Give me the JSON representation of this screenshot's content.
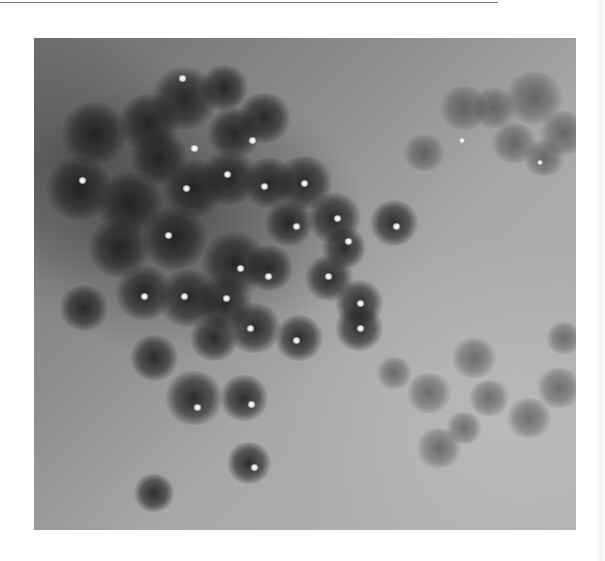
{
  "figure": {
    "palette": {
      "background_light": "#b2b2b2",
      "background_dark": "#6e6e6e",
      "papule": "#232323",
      "highlight": "#ffffff",
      "page": "#ffffff",
      "rule": "#7a7a7a"
    },
    "papules": [
      {
        "x": 150,
        "y": 60,
        "r": 30,
        "glint": false
      },
      {
        "x": 115,
        "y": 85,
        "r": 28,
        "glint": false
      },
      {
        "x": 60,
        "y": 95,
        "r": 30,
        "glint": false
      },
      {
        "x": 190,
        "y": 50,
        "r": 22,
        "glint": true,
        "gx": 148,
        "gy": 40
      },
      {
        "x": 230,
        "y": 80,
        "r": 24,
        "glint": false
      },
      {
        "x": 125,
        "y": 120,
        "r": 26,
        "glint": true,
        "gx": 160,
        "gy": 110
      },
      {
        "x": 200,
        "y": 95,
        "r": 24,
        "glint": true,
        "gx": 218,
        "gy": 102
      },
      {
        "x": 45,
        "y": 150,
        "r": 30,
        "glint": true,
        "gx": 48,
        "gy": 142
      },
      {
        "x": 95,
        "y": 165,
        "r": 30,
        "glint": false
      },
      {
        "x": 160,
        "y": 150,
        "r": 28,
        "glint": true,
        "gx": 152,
        "gy": 150
      },
      {
        "x": 195,
        "y": 140,
        "r": 26,
        "glint": true,
        "gx": 193,
        "gy": 136
      },
      {
        "x": 235,
        "y": 145,
        "r": 24,
        "glint": true,
        "gx": 230,
        "gy": 148
      },
      {
        "x": 270,
        "y": 145,
        "r": 26,
        "glint": true,
        "gx": 270,
        "gy": 145
      },
      {
        "x": 255,
        "y": 185,
        "r": 22,
        "glint": true,
        "gx": 262,
        "gy": 188
      },
      {
        "x": 300,
        "y": 180,
        "r": 24,
        "glint": true,
        "gx": 303,
        "gy": 180
      },
      {
        "x": 360,
        "y": 185,
        "r": 22,
        "glint": true,
        "gx": 362,
        "gy": 188
      },
      {
        "x": 310,
        "y": 210,
        "r": 20,
        "glint": true,
        "gx": 314,
        "gy": 203
      },
      {
        "x": 85,
        "y": 210,
        "r": 28,
        "glint": false
      },
      {
        "x": 140,
        "y": 200,
        "r": 30,
        "glint": true,
        "gx": 134,
        "gy": 197
      },
      {
        "x": 200,
        "y": 225,
        "r": 30,
        "glint": true,
        "gx": 206,
        "gy": 230
      },
      {
        "x": 235,
        "y": 230,
        "r": 22,
        "glint": true,
        "gx": 234,
        "gy": 238
      },
      {
        "x": 110,
        "y": 255,
        "r": 26,
        "glint": true,
        "gx": 110,
        "gy": 258
      },
      {
        "x": 155,
        "y": 260,
        "r": 28,
        "glint": true,
        "gx": 150,
        "gy": 258
      },
      {
        "x": 190,
        "y": 265,
        "r": 26,
        "glint": true,
        "gx": 192,
        "gy": 260
      },
      {
        "x": 295,
        "y": 240,
        "r": 22,
        "glint": true,
        "gx": 294,
        "gy": 238
      },
      {
        "x": 325,
        "y": 265,
        "r": 22,
        "glint": true,
        "gx": 326,
        "gy": 265
      },
      {
        "x": 50,
        "y": 270,
        "r": 22,
        "glint": false
      },
      {
        "x": 220,
        "y": 290,
        "r": 24,
        "glint": true,
        "gx": 216,
        "gy": 290
      },
      {
        "x": 265,
        "y": 300,
        "r": 22,
        "glint": true,
        "gx": 262,
        "gy": 302
      },
      {
        "x": 325,
        "y": 290,
        "r": 22,
        "glint": true,
        "gx": 326,
        "gy": 290
      },
      {
        "x": 180,
        "y": 300,
        "r": 22,
        "glint": false
      },
      {
        "x": 120,
        "y": 320,
        "r": 22,
        "glint": false
      },
      {
        "x": 160,
        "y": 360,
        "r": 26,
        "glint": true,
        "gx": 163,
        "gy": 369
      },
      {
        "x": 210,
        "y": 360,
        "r": 22,
        "glint": true,
        "gx": 217,
        "gy": 366
      },
      {
        "x": 215,
        "y": 425,
        "r": 20,
        "glint": true,
        "gx": 220,
        "gy": 429
      },
      {
        "x": 120,
        "y": 455,
        "r": 18,
        "glint": false
      }
    ],
    "faint_papules": [
      {
        "x": 430,
        "y": 70,
        "r": 22
      },
      {
        "x": 460,
        "y": 70,
        "r": 20
      },
      {
        "x": 500,
        "y": 60,
        "r": 26
      },
      {
        "x": 530,
        "y": 95,
        "r": 22
      },
      {
        "x": 480,
        "y": 105,
        "r": 20
      },
      {
        "x": 510,
        "y": 120,
        "r": 18
      },
      {
        "x": 390,
        "y": 115,
        "r": 18
      },
      {
        "x": 440,
        "y": 320,
        "r": 20
      },
      {
        "x": 395,
        "y": 355,
        "r": 20
      },
      {
        "x": 455,
        "y": 360,
        "r": 18
      },
      {
        "x": 495,
        "y": 380,
        "r": 20
      },
      {
        "x": 525,
        "y": 350,
        "r": 20
      },
      {
        "x": 405,
        "y": 410,
        "r": 20
      },
      {
        "x": 430,
        "y": 390,
        "r": 16
      },
      {
        "x": 360,
        "y": 335,
        "r": 16
      },
      {
        "x": 530,
        "y": 300,
        "r": 16
      }
    ],
    "small_glints": [
      {
        "x": 428,
        "y": 102
      },
      {
        "x": 506,
        "y": 124
      }
    ]
  }
}
